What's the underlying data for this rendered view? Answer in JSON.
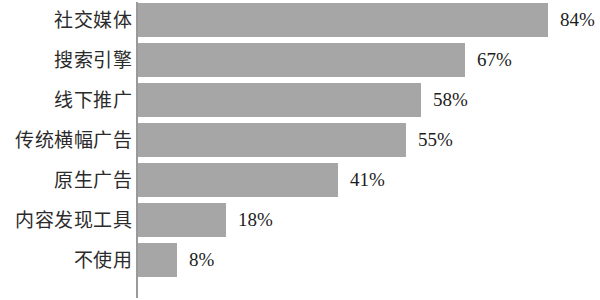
{
  "chart_data": {
    "type": "bar",
    "orientation": "horizontal",
    "title": "",
    "subtitle": "",
    "xlabel": "",
    "ylabel": "",
    "xlim": [
      0,
      84
    ],
    "grid": false,
    "legend": null,
    "value_suffix": "%",
    "bar_color": "#a6a6a6",
    "axis_color": "#9a9a9a",
    "background": "#ffffff",
    "categories": [
      "社交媒体",
      "搜索引擎",
      "线下推广",
      "传统横幅广告",
      "原生广告",
      "内容发现工具",
      "不使用"
    ],
    "values": [
      84,
      67,
      58,
      55,
      41,
      18,
      8
    ],
    "labels": [
      "84%",
      "67%",
      "58%",
      "55%",
      "41%",
      "18%",
      "8%"
    ]
  }
}
